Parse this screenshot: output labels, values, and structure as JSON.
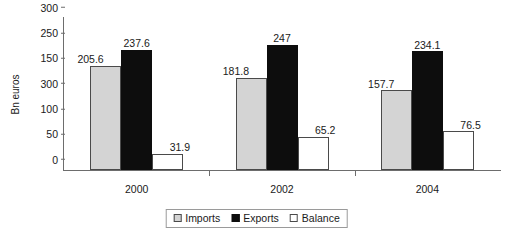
{
  "chart_data": {
    "type": "bar",
    "title": "",
    "xlabel": "",
    "ylabel": "Bn euros",
    "categories": [
      "2000",
      "2002",
      "2004"
    ],
    "series": [
      {
        "name": "Imports",
        "color": "#d4d4d4",
        "values": [
          205.6,
          181.8,
          157.7
        ]
      },
      {
        "name": "Exports",
        "color": "#0d0d0d",
        "values": [
          237.6,
          247,
          234.1
        ]
      },
      {
        "name": "Balance",
        "color": "#ffffff",
        "values": [
          31.9,
          65.2,
          76.5
        ]
      }
    ],
    "value_labels": [
      [
        "205.6",
        "237.6",
        "31.9"
      ],
      [
        "181.8",
        "247",
        "65.2"
      ],
      [
        "157.7",
        "234.1",
        "76.5"
      ]
    ],
    "ylim": [
      0,
      300
    ],
    "y_ticks": [
      0,
      50,
      100,
      150,
      200,
      250,
      300
    ],
    "y_tick_labels": [
      "0",
      "50",
      "100",
      "300",
      "150",
      "250",
      "300"
    ],
    "grid": false,
    "legend_position": "bottom-center",
    "legend_entries": [
      "Imports",
      "Exports",
      "Balance"
    ]
  }
}
